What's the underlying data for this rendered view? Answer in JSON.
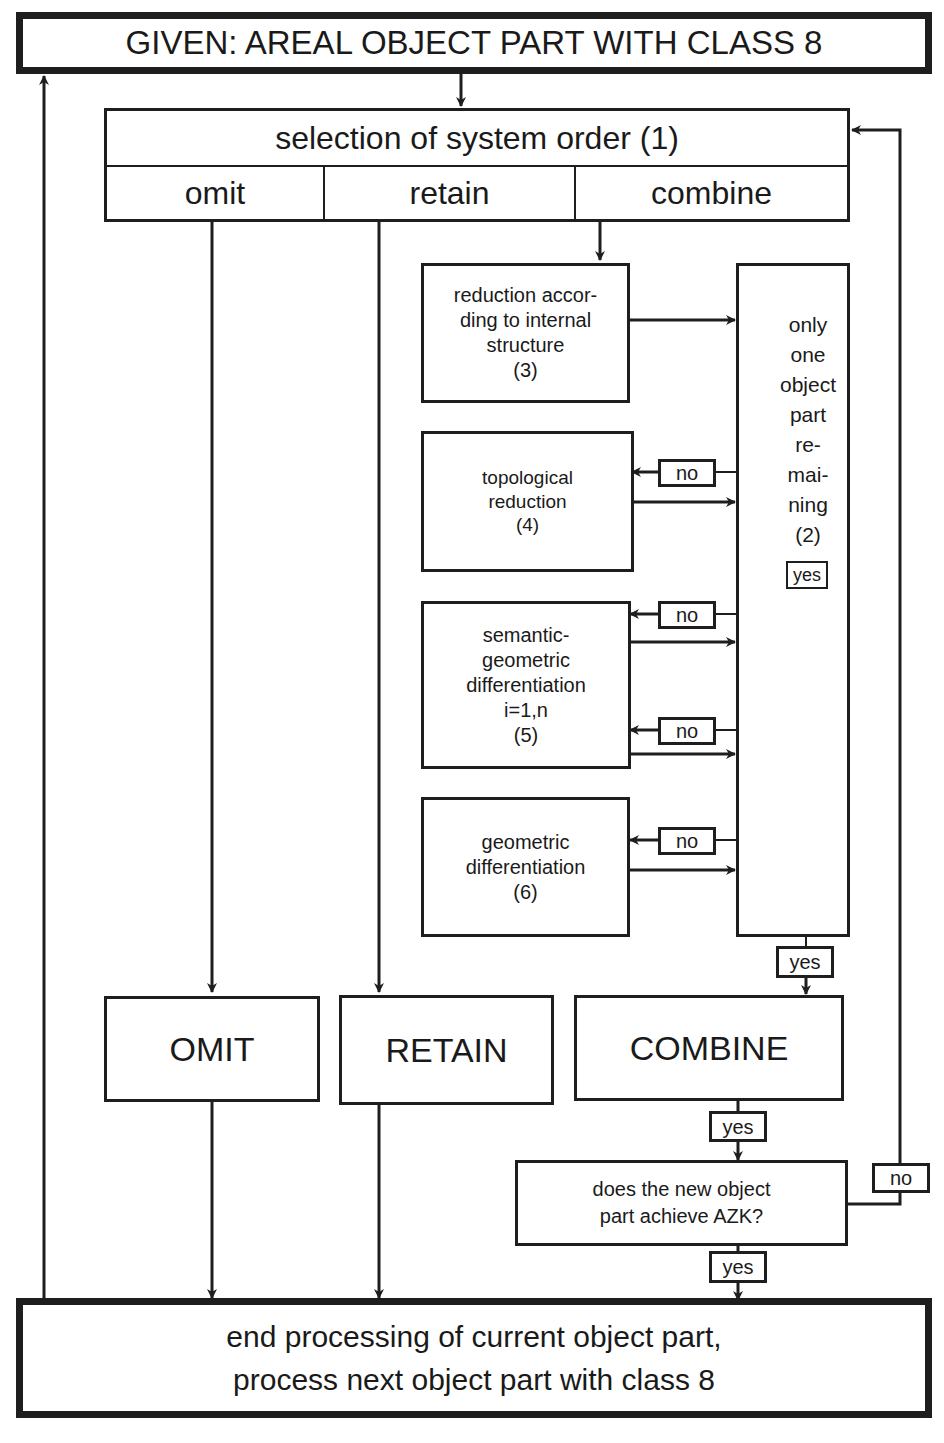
{
  "title": "GIVEN: AREAL OBJECT PART WITH CLASS 8",
  "selection": {
    "header": "selection of system order (1)",
    "options": [
      "omit",
      "retain",
      "combine"
    ]
  },
  "process_steps": [
    {
      "id": 3,
      "label": "reduction accor-\nding to internal\nstructure\n(3)"
    },
    {
      "id": 4,
      "label": "topological\nreduction\n(4)"
    },
    {
      "id": 5,
      "label": "semantic-\ngeometric\ndifferentiation\ni=1,n\n(5)"
    },
    {
      "id": 6,
      "label": "geometric\ndifferentiation\n(6)"
    }
  ],
  "decision_remaining": "only\none\nobject\npart\nre-\nmai-\nning\n(2)",
  "branch_labels": {
    "yes": "yes",
    "no": "no"
  },
  "outcomes": {
    "omit": "OMIT",
    "retain": "RETAIN",
    "combine": "COMBINE"
  },
  "decision_azk": "does the new object\npart achieve AZK?",
  "end_box": "end processing of current object part,\nprocess next object part with class 8"
}
